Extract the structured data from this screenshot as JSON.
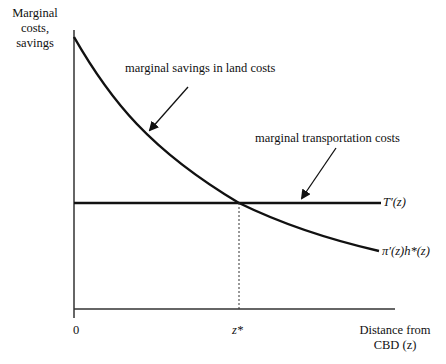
{
  "diagram": {
    "y_axis_label": "Marginal costs, savings",
    "y_axis_label_lines": [
      "Marginal",
      "costs,",
      "savings"
    ],
    "x_axis_label_lines": [
      "Distance from",
      "CBD (z)"
    ],
    "x_ticks": {
      "origin": "0",
      "equilibrium": "z*"
    },
    "curves": [
      {
        "id": "land-savings",
        "label": "π′(z)h*(z)",
        "shape": "convex-decreasing"
      },
      {
        "id": "transport-cost",
        "label": "T′(z)",
        "shape": "horizontal"
      }
    ],
    "annotations": {
      "land_savings": "marginal savings in land costs",
      "transport_costs": "marginal transportation costs"
    },
    "colors": {
      "line": "#111111",
      "background": "#ffffff"
    }
  }
}
